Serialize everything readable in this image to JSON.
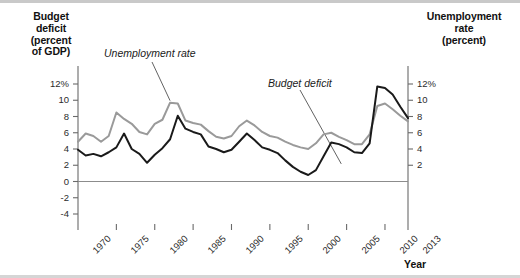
{
  "chart_data": {
    "type": "line",
    "title": "",
    "xlabel": "Year",
    "axes": {
      "x": {
        "min": 1970,
        "max": 2013,
        "tick_labels": [
          "1970",
          "1975",
          "1980",
          "1985",
          "1990",
          "1995",
          "2000",
          "2005",
          "2010",
          "2013"
        ],
        "tick_values": [
          1970,
          1975,
          1980,
          1985,
          1990,
          1995,
          2000,
          2005,
          2010,
          2013
        ],
        "grid": false
      },
      "y_left": {
        "label": "Budget deficit (percent of GDP)",
        "label_lines": [
          "Budget",
          "deficit",
          "(percent",
          "of GDP)"
        ],
        "min": -4,
        "max": 12,
        "tick_labels": [
          "12%",
          "10",
          "8",
          "6",
          "4",
          "2",
          "0",
          "-2",
          "-4"
        ],
        "tick_values": [
          12,
          10,
          8,
          6,
          4,
          2,
          0,
          -2,
          -4
        ],
        "zero_line": 0
      },
      "y_right": {
        "label": "Unemployment rate (percent)",
        "label_lines": [
          "Unemployment",
          "rate",
          "(percent)"
        ],
        "min": 2,
        "max": 12,
        "tick_labels": [
          "12%",
          "10",
          "8",
          "6",
          "4",
          "2"
        ],
        "tick_values": [
          12,
          10,
          8,
          6,
          4,
          2
        ]
      }
    },
    "legend_position": "inline-annotations",
    "annotations": [
      {
        "text": "Unemployment rate",
        "points_to_year": 1982,
        "points_to_value": 9.7
      },
      {
        "text": "Budget deficit",
        "points_to_year": 2003,
        "points_to_value": 3.4
      }
    ],
    "series": [
      {
        "name": "Budget deficit",
        "axis": "y_left",
        "units": "percent of GDP",
        "color": "#1a1a1a",
        "x": [
          1970,
          1971,
          1972,
          1973,
          1974,
          1975,
          1976,
          1977,
          1978,
          1979,
          1980,
          1981,
          1982,
          1983,
          1984,
          1985,
          1986,
          1987,
          1988,
          1989,
          1990,
          1991,
          1992,
          1993,
          1994,
          1995,
          1996,
          1997,
          1998,
          1999,
          2000,
          2001,
          2002,
          2003,
          2004,
          2005,
          2006,
          2007,
          2008,
          2009,
          2010,
          2011,
          2012,
          2013
        ],
        "values": [
          3.9,
          3.2,
          3.4,
          3.1,
          3.6,
          4.2,
          5.9,
          4.0,
          3.4,
          2.3,
          3.3,
          4.1,
          5.2,
          8.1,
          6.5,
          6.1,
          5.8,
          4.3,
          4.0,
          3.6,
          3.9,
          4.9,
          5.9,
          5.1,
          4.2,
          3.9,
          3.5,
          2.6,
          1.8,
          1.2,
          0.8,
          1.4,
          3.1,
          4.8,
          4.6,
          4.2,
          3.6,
          3.5,
          4.7,
          11.7,
          11.5,
          10.7,
          9.2,
          7.8
        ]
      },
      {
        "name": "Unemployment rate",
        "axis": "y_right",
        "units": "percent",
        "color": "#9a9a9a",
        "x": [
          1970,
          1971,
          1972,
          1973,
          1974,
          1975,
          1976,
          1977,
          1978,
          1979,
          1980,
          1981,
          1982,
          1983,
          1984,
          1985,
          1986,
          1987,
          1988,
          1989,
          1990,
          1991,
          1992,
          1993,
          1994,
          1995,
          1996,
          1997,
          1998,
          1999,
          2000,
          2001,
          2002,
          2003,
          2004,
          2005,
          2006,
          2007,
          2008,
          2009,
          2010,
          2011,
          2012,
          2013
        ],
        "values": [
          4.9,
          5.9,
          5.6,
          4.9,
          5.6,
          8.5,
          7.7,
          7.1,
          6.1,
          5.8,
          7.1,
          7.6,
          9.7,
          9.6,
          7.5,
          7.2,
          7.0,
          6.2,
          5.5,
          5.3,
          5.6,
          6.8,
          7.5,
          6.9,
          6.1,
          5.6,
          5.4,
          4.9,
          4.5,
          4.2,
          4.0,
          4.7,
          5.8,
          6.0,
          5.5,
          5.1,
          4.6,
          4.6,
          5.8,
          9.3,
          9.6,
          8.9,
          8.1,
          7.4
        ]
      }
    ]
  },
  "plot_geometry": {
    "x0": 78,
    "x1": 408,
    "y_top": 84,
    "y_bottom": 214,
    "left_tick_top_value": 12,
    "left_tick_bottom_value": -4,
    "right_tick_top_value": 12,
    "right_tick_bottom_value": 2
  }
}
